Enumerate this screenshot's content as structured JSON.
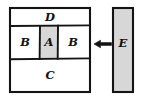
{
  "diagram": {
    "background_color": "#ffffff",
    "ink_color": "#141414",
    "shaded_color": "#d7d7d7",
    "white_color": "#ffffff",
    "main_box": {
      "name": "main-rectangle",
      "x": 10,
      "y": 8,
      "width": 80,
      "height": 84
    },
    "rows": [
      {
        "id": "row-top",
        "label": "D",
        "fill": "#ffffff",
        "x": 10,
        "y": 8,
        "width": 80,
        "height": 18,
        "label_x": 50,
        "label_y": 17.5
      },
      {
        "id": "row-middle",
        "label": "",
        "fill": "#ffffff",
        "x": 10,
        "y": 26,
        "width": 80,
        "height": 33
      },
      {
        "id": "row-bottom",
        "label": "C",
        "fill": "#ffffff",
        "x": 10,
        "y": 59,
        "width": 80,
        "height": 33,
        "label_x": 50,
        "label_y": 76
      }
    ],
    "middle_cells": [
      {
        "id": "cell-b-left",
        "label": "B",
        "fill": "#ffffff",
        "x": 10,
        "y": 26,
        "width": 30,
        "height": 33,
        "label_x": 25,
        "label_y": 43
      },
      {
        "id": "cell-a",
        "label": "A",
        "fill": "#d7d7d7",
        "x": 40,
        "y": 26,
        "width": 18,
        "height": 33,
        "label_x": 49,
        "label_y": 43
      },
      {
        "id": "cell-b-right",
        "label": "B",
        "fill": "#ffffff",
        "x": 58,
        "y": 26,
        "width": 32,
        "height": 33,
        "label_x": 73,
        "label_y": 43
      }
    ],
    "side_bar": {
      "id": "bar-e",
      "label": "E",
      "fill": "#d7d7d7",
      "x": 113,
      "y": 8,
      "width": 20,
      "height": 84,
      "label_x": 123,
      "label_y": 44
    },
    "arrow": {
      "id": "arrow-left",
      "direction": "left",
      "from_x": 112,
      "to_x": 94,
      "y": 44
    }
  }
}
